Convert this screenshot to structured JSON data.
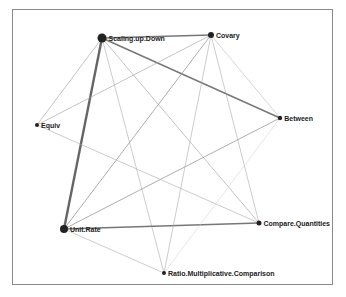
{
  "diagram": {
    "type": "network-graph",
    "nodes": [
      {
        "id": "scaling",
        "label": "Scaling.up.Down",
        "x": 102,
        "y": 38,
        "r": 4.5
      },
      {
        "id": "covary",
        "label": "Covary",
        "x": 211,
        "y": 35,
        "r": 3
      },
      {
        "id": "equiv",
        "label": "Equiv",
        "x": 37,
        "y": 125,
        "r": 2
      },
      {
        "id": "between",
        "label": "Between",
        "x": 280,
        "y": 118,
        "r": 2.2
      },
      {
        "id": "unitrate",
        "label": "Unit.Rate",
        "x": 64,
        "y": 229,
        "r": 4
      },
      {
        "id": "compare",
        "label": "Compare.Quantities",
        "x": 259,
        "y": 223,
        "r": 2.5
      },
      {
        "id": "ratio",
        "label": "Ratio.Multiplicative.Comparison",
        "x": 164,
        "y": 273,
        "r": 2
      }
    ],
    "edges": [
      {
        "from": "scaling",
        "to": "unitrate",
        "width": 2.4,
        "color": "#666666"
      },
      {
        "from": "scaling",
        "to": "covary",
        "width": 1.4,
        "color": "#777777"
      },
      {
        "from": "scaling",
        "to": "between",
        "width": 1.4,
        "color": "#777777"
      },
      {
        "from": "scaling",
        "to": "equiv",
        "width": 0.7,
        "color": "#aaaaaa"
      },
      {
        "from": "scaling",
        "to": "ratio",
        "width": 0.6,
        "color": "#aaaaaa"
      },
      {
        "from": "scaling",
        "to": "compare",
        "width": 0.7,
        "color": "#aaaaaa"
      },
      {
        "from": "unitrate",
        "to": "compare",
        "width": 1.6,
        "color": "#777777"
      },
      {
        "from": "unitrate",
        "to": "covary",
        "width": 0.8,
        "color": "#999999"
      },
      {
        "from": "unitrate",
        "to": "between",
        "width": 0.8,
        "color": "#999999"
      },
      {
        "from": "unitrate",
        "to": "ratio",
        "width": 0.6,
        "color": "#aaaaaa"
      },
      {
        "from": "covary",
        "to": "equiv",
        "width": 0.7,
        "color": "#aaaaaa"
      },
      {
        "from": "covary",
        "to": "between",
        "width": 0.6,
        "color": "#bbbbbb"
      },
      {
        "from": "covary",
        "to": "compare",
        "width": 0.6,
        "color": "#aaaaaa"
      },
      {
        "from": "covary",
        "to": "ratio",
        "width": 0.6,
        "color": "#aaaaaa"
      },
      {
        "from": "equiv",
        "to": "compare",
        "width": 0.6,
        "color": "#aaaaaa"
      },
      {
        "from": "between",
        "to": "ratio",
        "width": 0.5,
        "color": "#cccccc"
      }
    ]
  }
}
